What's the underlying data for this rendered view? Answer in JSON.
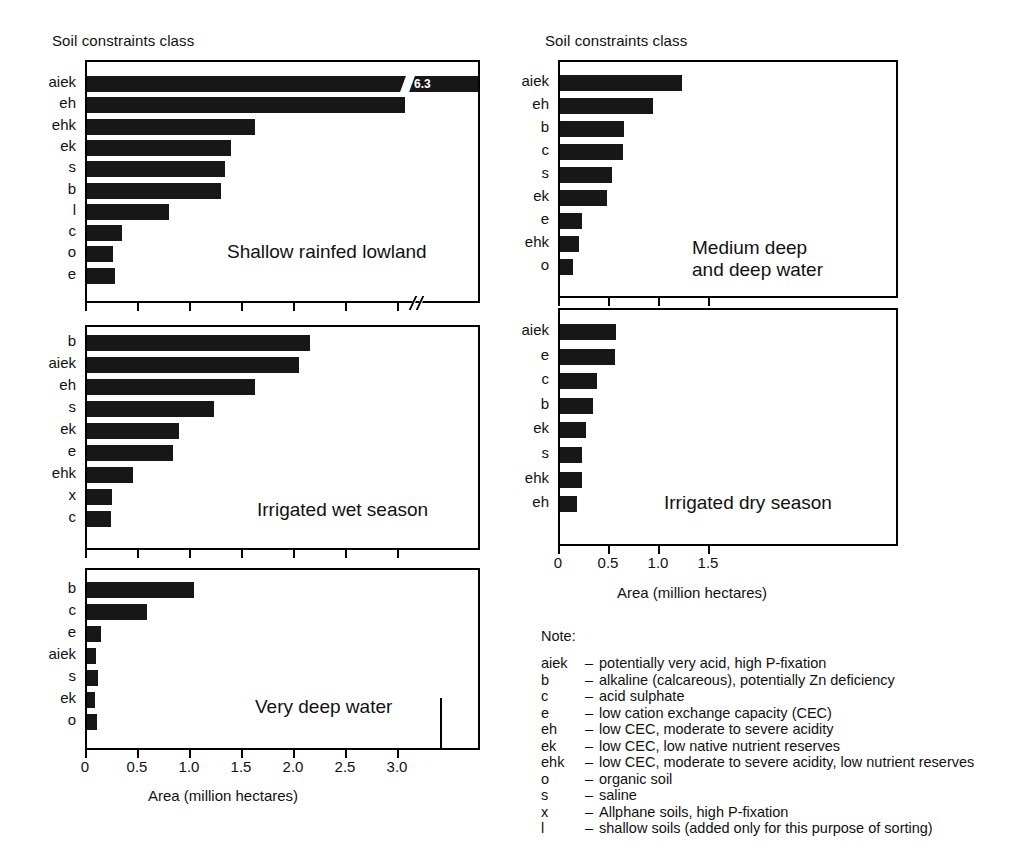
{
  "axis_title_left": "Soil constraints class",
  "axis_title_right": "Soil constraints class",
  "xlabel": "Area (million hectares)",
  "chart_data": [
    {
      "id": "shallow-rainfed-lowland",
      "type": "bar",
      "orientation": "horizontal",
      "title": "Shallow rainfed lowland",
      "xlabel": "Area (million hectares)",
      "ylabel": "Soil constraints class",
      "xlim": [
        0,
        3.45
      ],
      "xticks": [
        0,
        0.5,
        1.0,
        1.5,
        2.0,
        2.5,
        3.0
      ],
      "xticklabels": [
        "0",
        "0.5",
        "1.0",
        "1.5",
        "2.0",
        "2.5",
        "3.0"
      ],
      "axis_break": true,
      "grid": false,
      "categories": [
        "aiek",
        "eh",
        "ehk",
        "ek",
        "s",
        "b",
        "l",
        "c",
        "o",
        "e"
      ],
      "values": [
        6.3,
        3.06,
        1.62,
        1.38,
        1.33,
        1.29,
        0.79,
        0.34,
        0.25,
        0.27
      ],
      "annotations": [
        {
          "category": "aiek",
          "text": "6.3",
          "note": "bar truncated with axis break"
        }
      ]
    },
    {
      "id": "medium-deep-and-deep-water",
      "type": "bar",
      "orientation": "horizontal",
      "title": "Medium deep and deep water",
      "title_lines": [
        "Medium deep",
        "and deep water"
      ],
      "xlabel": "Area (million hectares)",
      "ylabel": "Soil constraints class",
      "xlim": [
        0,
        1.9
      ],
      "xticks": [
        0,
        0.5,
        1.0,
        1.5
      ],
      "xticklabels": [
        "0",
        "0.5",
        "1.0",
        "1.5"
      ],
      "axis_break": false,
      "grid": false,
      "categories": [
        "aiek",
        "eh",
        "b",
        "c",
        "s",
        "ek",
        "e",
        "ehk",
        "o"
      ],
      "values": [
        1.22,
        0.93,
        0.64,
        0.63,
        0.52,
        0.47,
        0.22,
        0.19,
        0.13
      ]
    },
    {
      "id": "irrigated-wet-season",
      "type": "bar",
      "orientation": "horizontal",
      "title": "Irrigated wet season",
      "xlabel": "Area (million hectares)",
      "ylabel": "Soil constraints class",
      "xlim": [
        0,
        3.45
      ],
      "xticks": [
        0,
        0.5,
        1.0,
        1.5,
        2.0,
        2.5,
        3.0
      ],
      "xticklabels": [
        "0",
        "0.5",
        "1.0",
        "1.5",
        "2.0",
        "2.5",
        "3.0"
      ],
      "axis_break": false,
      "grid": false,
      "categories": [
        "b",
        "aiek",
        "eh",
        "s",
        "ek",
        "e",
        "ehk",
        "x",
        "c"
      ],
      "values": [
        2.14,
        2.04,
        1.62,
        1.22,
        0.88,
        0.83,
        0.44,
        0.24,
        0.23
      ]
    },
    {
      "id": "irrigated-dry-season",
      "type": "bar",
      "orientation": "horizontal",
      "title": "Irrigated dry season",
      "xlabel": "Area (million hectares)",
      "ylabel": "Soil constraints class",
      "xlim": [
        0,
        1.9
      ],
      "xticks": [
        0,
        0.5,
        1.0,
        1.5
      ],
      "xticklabels": [
        "0",
        "0.5",
        "1.0",
        "1.5"
      ],
      "axis_break": false,
      "grid": false,
      "categories": [
        "aiek",
        "e",
        "c",
        "b",
        "ek",
        "s",
        "ehk",
        "eh"
      ],
      "values": [
        0.56,
        0.55,
        0.37,
        0.33,
        0.26,
        0.22,
        0.22,
        0.17
      ]
    },
    {
      "id": "very-deep-water",
      "type": "bar",
      "orientation": "horizontal",
      "title": "Very deep water",
      "xlabel": "Area (million hectares)",
      "ylabel": "Soil constraints class",
      "xlim": [
        0,
        3.45
      ],
      "xticks": [
        0,
        0.5,
        1.0,
        1.5,
        2.0,
        2.5,
        3.0
      ],
      "xticklabels": [
        "0",
        "0.5",
        "1.0",
        "1.5",
        "2.0",
        "2.5",
        "3.0"
      ],
      "axis_break": false,
      "grid": false,
      "categories": [
        "b",
        "c",
        "e",
        "aiek",
        "s",
        "ek",
        "o"
      ],
      "values": [
        1.03,
        0.58,
        0.13,
        0.09,
        0.11,
        0.08,
        0.1
      ]
    }
  ],
  "note": {
    "title": "Note:",
    "entries": [
      {
        "key": "aiek",
        "dash": "–",
        "text": "potentially very acid, high P-fixation"
      },
      {
        "key": "b",
        "dash": "–",
        "text": "alkaline (calcareous), potentially Zn deficiency"
      },
      {
        "key": "c",
        "dash": "–",
        "text": "acid sulphate"
      },
      {
        "key": "e",
        "dash": "–",
        "text": "low cation exchange capacity (CEC)"
      },
      {
        "key": "eh",
        "dash": "–",
        "text": "low CEC, moderate to severe acidity"
      },
      {
        "key": "ek",
        "dash": "–",
        "text": "low CEC, low native nutrient reserves"
      },
      {
        "key": "ehk",
        "dash": "–",
        "text": "low CEC, moderate to severe acidity, low nutrient reserves"
      },
      {
        "key": "o",
        "dash": "–",
        "text": "organic soil"
      },
      {
        "key": "s",
        "dash": "–",
        "text": "saline"
      },
      {
        "key": "x",
        "dash": "–",
        "text": "Allphane soils, high P-fixation"
      },
      {
        "key": "l",
        "dash": "–",
        "text": "shallow soils (added only for this purpose of sorting)"
      }
    ]
  },
  "colors": {
    "bar": "#171717",
    "axis": "#000000",
    "background": "#ffffff",
    "value_label": "#ffffff"
  }
}
